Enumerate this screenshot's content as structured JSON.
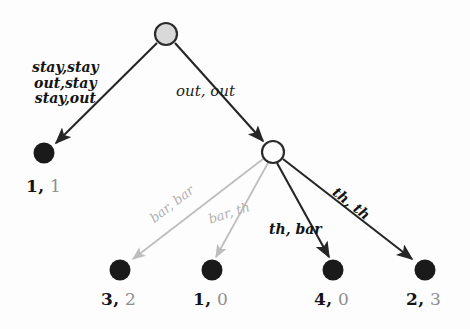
{
  "figure": {
    "type": "game-tree",
    "background_color": "#fdfdfd",
    "colors": {
      "dark_edge": "#262626",
      "gray_edge": "#bdbdbd",
      "root_fill": "#d9d9d9",
      "node_outline": "#2b2b2b",
      "terminal_fill": "#1a1a1a",
      "payoff_player1": "#151515",
      "payoff_player2": "#8e8e8e",
      "label_dark": "#141414",
      "label_gray": "#b0b0b0"
    }
  },
  "nodes": {
    "root": {
      "name": "root-decision-node",
      "x": 166,
      "y": 34,
      "r": 11,
      "style": "gray-filled"
    },
    "second": {
      "name": "second-decision-node",
      "x": 273,
      "y": 152,
      "r": 11,
      "style": "hollow"
    },
    "t_left": {
      "name": "terminal-node-1",
      "x": 44,
      "y": 153,
      "r": 10,
      "style": "filled"
    },
    "t_b1": {
      "name": "terminal-node-2",
      "x": 120,
      "y": 270,
      "r": 10,
      "style": "filled"
    },
    "t_b2": {
      "name": "terminal-node-3",
      "x": 212,
      "y": 270,
      "r": 10,
      "style": "filled"
    },
    "t_b3": {
      "name": "terminal-node-4",
      "x": 333,
      "y": 270,
      "r": 10,
      "style": "filled"
    },
    "t_b4": {
      "name": "terminal-node-5",
      "x": 425,
      "y": 270,
      "r": 10,
      "style": "filled"
    }
  },
  "edges": [
    {
      "id": "e-stay",
      "from": "root",
      "to": "t_left",
      "color": "dark",
      "label_lines": [
        "stay,stay",
        "out,stay",
        "stay,out"
      ]
    },
    {
      "id": "e-outout",
      "from": "root",
      "to": "second",
      "color": "dark",
      "label": "out, out"
    },
    {
      "id": "e-barbar",
      "from": "second",
      "to": "t_b1",
      "color": "gray",
      "label": "bar, bar"
    },
    {
      "id": "e-barth",
      "from": "second",
      "to": "t_b2",
      "color": "gray",
      "label": "bar, th"
    },
    {
      "id": "e-thbar",
      "from": "second",
      "to": "t_b3",
      "color": "dark",
      "label": "th, bar"
    },
    {
      "id": "e-thth",
      "from": "second",
      "to": "t_b4",
      "color": "dark",
      "label": "th, th"
    }
  ],
  "labels": {
    "stay_block_line1": "stay,stay",
    "stay_block_line2": "out,stay",
    "stay_block_line3": "stay,out",
    "out_out": "out, out",
    "bar_bar": "bar, bar",
    "bar_th": "bar, th",
    "th_bar": "th, bar",
    "th_th": "th, th"
  },
  "payoffs": [
    {
      "id": "payoff-1",
      "node": "t_left",
      "player1": "1,",
      "player2": "1",
      "x": 26,
      "y": 176
    },
    {
      "id": "payoff-2",
      "node": "t_b1",
      "player1": "3,",
      "player2": "2",
      "x": 101,
      "y": 289
    },
    {
      "id": "payoff-3",
      "node": "t_b2",
      "player1": "1,",
      "player2": "0",
      "x": 193,
      "y": 289
    },
    {
      "id": "payoff-4",
      "node": "t_b3",
      "player1": "4,",
      "player2": "0",
      "x": 314,
      "y": 289
    },
    {
      "id": "payoff-5",
      "node": "t_b4",
      "player1": "2,",
      "player2": "3",
      "x": 406,
      "y": 289
    }
  ]
}
